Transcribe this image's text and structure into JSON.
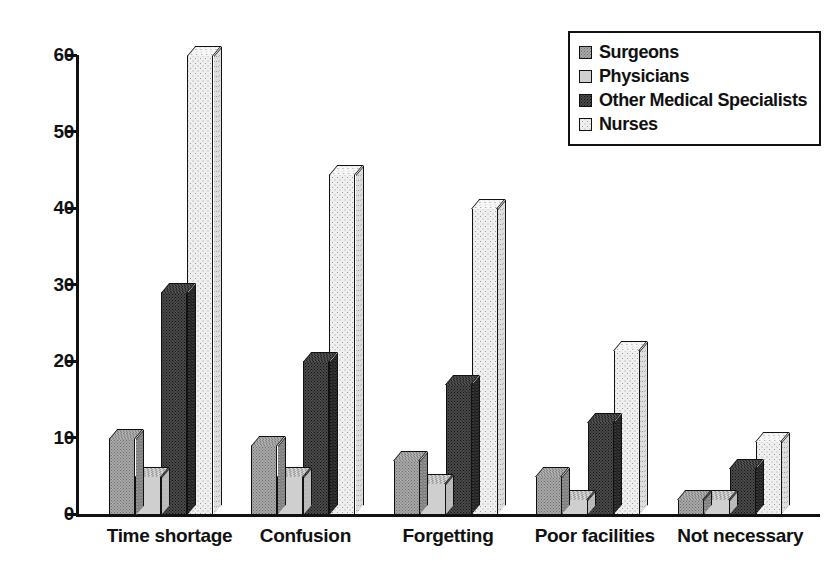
{
  "chart_data": {
    "type": "bar",
    "title": "",
    "subtitle": "",
    "xlabel": "",
    "ylabel": "",
    "ylim": [
      0,
      60
    ],
    "yticks": [
      0,
      10,
      20,
      30,
      40,
      50,
      60
    ],
    "ytick_labels": [
      "0",
      "10",
      "20",
      "30",
      "40",
      "50",
      "60"
    ],
    "grid": false,
    "legend_position": "top-right",
    "style": "3d-bars-dithered-grayscale",
    "categories": [
      "Time shortage",
      "Confusion",
      "Forgetting",
      "Poor facilities",
      "Not necessary"
    ],
    "series": [
      {
        "name": "Surgeons",
        "key": "surgeons",
        "fill": "medium-gray-dither",
        "color": "#a8a8a8",
        "values": [
          10,
          9,
          7,
          5,
          2
        ]
      },
      {
        "name": "Physicians",
        "key": "physicians",
        "fill": "light-gray-dither",
        "color": "#cfcfcf",
        "values": [
          5,
          5,
          4,
          2,
          2
        ]
      },
      {
        "name": "Other Medical Specialists",
        "key": "oms",
        "fill": "dark-gray-dither",
        "color": "#4a4a4a",
        "values": [
          29,
          20,
          17,
          12,
          6
        ]
      },
      {
        "name": "Nurses",
        "key": "nurses",
        "fill": "white-dither",
        "color": "#efefef",
        "values": [
          60,
          44.5,
          40,
          21.5,
          9.5
        ]
      }
    ]
  },
  "legend": {
    "items": [
      {
        "label": "Surgeons",
        "swatch": "legend-swatch-surgeons"
      },
      {
        "label": "Physicians",
        "swatch": "legend-swatch-physicians"
      },
      {
        "label": "Other Medical Specialists",
        "swatch": "legend-swatch-oms"
      },
      {
        "label": "Nurses",
        "swatch": "legend-swatch-nurses"
      }
    ]
  }
}
